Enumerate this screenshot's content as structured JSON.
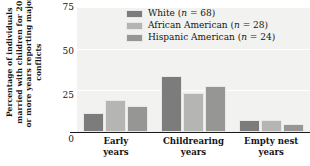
{
  "chart_data": {
    "type": "bar",
    "title": "",
    "xlabel": "",
    "ylabel": "Percentage of individuals married with children for 20 or more years reporting major conflicts",
    "ylim": [
      0,
      75
    ],
    "yticks": [
      75,
      50,
      25,
      0
    ],
    "grid": true,
    "legend_position": "top-center",
    "categories": [
      "Early years",
      "Childrearing years",
      "Empty nest years"
    ],
    "category_lines": [
      [
        "Early",
        "years"
      ],
      [
        "Childrearing",
        "years"
      ],
      [
        "Empty nest",
        "years"
      ]
    ],
    "series": [
      {
        "name": "White",
        "n": 68,
        "legend_label": "White (n = 68)",
        "color": "#7c7c7c",
        "values": [
          11.5,
          33.5,
          7.5
        ]
      },
      {
        "name": "African American",
        "n": 28,
        "legend_label": "African American (n = 28)",
        "color": "#b5b5b3",
        "values": [
          19.5,
          23.5,
          7.0
        ]
      },
      {
        "name": "Hispanic American",
        "n": 24,
        "legend_label": "Hispanic American (n = 24)",
        "color": "#969694",
        "values": [
          15.5,
          27.5,
          5.0
        ]
      }
    ]
  },
  "style": {
    "plot_background": "#f2f2f0",
    "page_background": "#ffffff",
    "axis_color": "#1a1a1a",
    "gridline_color": "#ffffff",
    "text_color": "#141414"
  },
  "ticks": {
    "t0": "75",
    "t1": "50",
    "t2": "25",
    "t3": "0"
  },
  "legend": {
    "item0_name": "White",
    "item0_n": "(n = 68)",
    "item1_name": "African American",
    "item1_n": "(n = 28)",
    "item2_name": "Hispanic American",
    "item2_n": "(n = 24)"
  },
  "xaxis": {
    "g0l0": "Early",
    "g0l1": "years",
    "g1l0": "Childrearing",
    "g1l1": "years",
    "g2l0": "Empty nest",
    "g2l1": "years"
  }
}
